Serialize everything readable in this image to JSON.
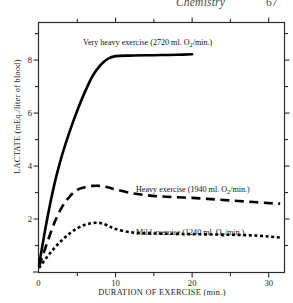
{
  "header": {
    "title": "Chemistry",
    "page_number": "67"
  },
  "chart_data": {
    "type": "line",
    "title": "",
    "xlabel": "DURATION OF EXERCISE (min.)",
    "ylabel": "LACTATE (mEq./liter of blood)",
    "ylabel_prefix": "LACTATE (mEq",
    "ylabel_suffix": "./liter of blood)",
    "xlim": [
      0,
      32
    ],
    "ylim": [
      0,
      9.4
    ],
    "xticks": [
      0,
      10,
      20,
      30
    ],
    "xtick_labels": [
      "0",
      "10",
      "20",
      "30"
    ],
    "yticks": [
      0,
      2,
      4,
      6,
      8
    ],
    "ytick_labels": [
      "0",
      "2",
      "4",
      "6",
      "8"
    ],
    "minor_xticks": [
      5,
      15,
      25
    ],
    "minor_yticks": [
      1,
      3,
      5,
      7,
      9
    ],
    "grid": false,
    "legend": "inline-annotations",
    "series": [
      {
        "name": "Very heavy exercise (2720 ml. O2/min.)",
        "label_prefix": "Very heavy exercise (2720 ml. O",
        "label_sub": "2",
        "label_suffix": "/min.)",
        "style": "solid",
        "color": "#000000",
        "linewidth": 2.6,
        "x": [
          0,
          1,
          2,
          3,
          4,
          5,
          6,
          7,
          8,
          9,
          10,
          12,
          14,
          16,
          18,
          20
        ],
        "y": [
          0.25,
          1.9,
          3.3,
          4.4,
          5.3,
          6.1,
          6.8,
          7.4,
          7.8,
          8.05,
          8.15,
          8.17,
          8.18,
          8.19,
          8.2,
          8.22
        ]
      },
      {
        "name": "Heavy exercise (1940 ml. O2/min.)",
        "label_prefix": "Heavy exercise (1940 ml. O",
        "label_sub": "2",
        "label_suffix": "/min.)",
        "style": "dashed",
        "color": "#000000",
        "linewidth": 2.6,
        "x": [
          0,
          1,
          2,
          3,
          4,
          5,
          6,
          7,
          8,
          9,
          10,
          12,
          14,
          16,
          18,
          20,
          22,
          24,
          26,
          28,
          30,
          31.5
        ],
        "y": [
          0.2,
          1.05,
          1.85,
          2.45,
          2.85,
          3.1,
          3.2,
          3.25,
          3.25,
          3.2,
          3.12,
          2.98,
          2.9,
          2.85,
          2.82,
          2.8,
          2.76,
          2.72,
          2.68,
          2.64,
          2.6,
          2.58
        ]
      },
      {
        "name": "Mild exercise (1240 ml. O2/min.)",
        "label_prefix": "Mild exercise (1240 ml. O",
        "label_sub": "2",
        "label_suffix": "/min.)",
        "style": "dotted",
        "color": "#000000",
        "linewidth": 2.6,
        "x": [
          0,
          1,
          2,
          3,
          4,
          5,
          6,
          7,
          8,
          9,
          10,
          12,
          14,
          16,
          18,
          20,
          22,
          24,
          26,
          28,
          30,
          31.5
        ],
        "y": [
          0.15,
          0.55,
          0.9,
          1.2,
          1.45,
          1.65,
          1.78,
          1.85,
          1.85,
          1.75,
          1.62,
          1.5,
          1.46,
          1.45,
          1.44,
          1.43,
          1.42,
          1.41,
          1.4,
          1.38,
          1.34,
          1.3
        ]
      }
    ]
  }
}
